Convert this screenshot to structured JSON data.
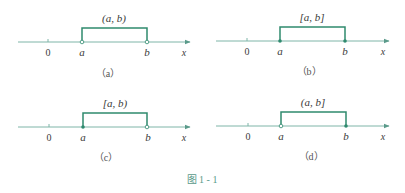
{
  "figure": {
    "caption": "图 1 - 1",
    "colors": {
      "axis": "#7fb5a8",
      "bracket": "#2f8a6e",
      "text": "#3a3a3a",
      "caption": "#5a9a8a"
    }
  },
  "panels": [
    {
      "id": "a",
      "sub_label": "（a）",
      "interval_label": "(a, b)",
      "origin_label": "0",
      "a_label": "a",
      "b_label": "b",
      "axis_label": "x",
      "a_endpoint": "open",
      "b_endpoint": "open"
    },
    {
      "id": "b",
      "sub_label": "（b）",
      "interval_label": "[a, b]",
      "origin_label": "0",
      "a_label": "a",
      "b_label": "b",
      "axis_label": "x",
      "a_endpoint": "closed",
      "b_endpoint": "closed"
    },
    {
      "id": "c",
      "sub_label": "（c）",
      "interval_label": "[a, b)",
      "origin_label": "0",
      "a_label": "a",
      "b_label": "b",
      "axis_label": "x",
      "a_endpoint": "closed",
      "b_endpoint": "open"
    },
    {
      "id": "d",
      "sub_label": "（d）",
      "interval_label": "(a, b]",
      "origin_label": "0",
      "a_label": "a",
      "b_label": "b",
      "axis_label": "x",
      "a_endpoint": "open",
      "b_endpoint": "closed"
    }
  ]
}
